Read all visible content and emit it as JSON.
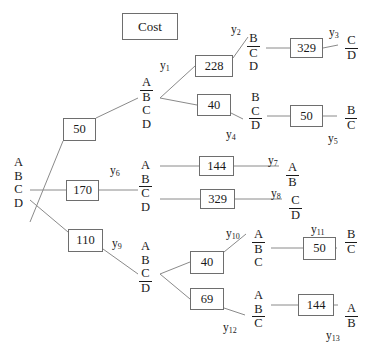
{
  "diagram": {
    "title_box": {
      "label": "Cost",
      "x": 122,
      "y": 13,
      "w": 56,
      "h": 27
    },
    "root": {
      "name": "root-node",
      "letters": [
        {
          "ch": "A",
          "underline": false
        },
        {
          "ch": "B",
          "underline": false
        },
        {
          "ch": "C",
          "underline": false
        },
        {
          "ch": "D",
          "underline": false
        }
      ],
      "x": 12,
      "y": 156
    },
    "nodes": [
      {
        "id": "y1",
        "label": "y",
        "sub": "1",
        "letters": [
          {
            "ch": "A",
            "underline": true
          },
          {
            "ch": "B",
            "underline": false
          },
          {
            "ch": "C",
            "underline": false
          },
          {
            "ch": "D",
            "underline": false
          }
        ],
        "x": 140,
        "y": 76,
        "lx": 160,
        "ly": 60
      },
      {
        "id": "y2",
        "label": "y",
        "sub": "2",
        "letters": [
          {
            "ch": "B",
            "underline": true
          },
          {
            "ch": "C",
            "underline": false
          },
          {
            "ch": "D",
            "underline": false
          }
        ],
        "x": 247,
        "y": 32,
        "lx": 231,
        "ly": 24
      },
      {
        "id": "y3",
        "label": "y",
        "sub": "3",
        "letters": [
          {
            "ch": "C",
            "underline": true
          },
          {
            "ch": "D",
            "underline": false
          }
        ],
        "x": 345,
        "y": 34,
        "lx": 329,
        "ly": 27
      },
      {
        "id": "y4",
        "label": "y",
        "sub": "4",
        "letters": [
          {
            "ch": "B",
            "underline": false
          },
          {
            "ch": "C",
            "underline": true
          },
          {
            "ch": "D",
            "underline": false
          }
        ],
        "x": 249,
        "y": 91,
        "lx": 226,
        "ly": 129
      },
      {
        "id": "y5",
        "label": "y",
        "sub": "5",
        "letters": [
          {
            "ch": "B",
            "underline": true
          },
          {
            "ch": "C",
            "underline": false
          }
        ],
        "x": 345,
        "y": 104,
        "lx": 328,
        "ly": 133
      },
      {
        "id": "y6",
        "label": "y",
        "sub": "6",
        "letters": [
          {
            "ch": "A",
            "underline": false
          },
          {
            "ch": "B",
            "underline": true
          },
          {
            "ch": "C",
            "underline": false
          },
          {
            "ch": "D",
            "underline": false
          }
        ],
        "x": 139,
        "y": 159,
        "lx": 110,
        "ly": 165
      },
      {
        "id": "y7",
        "label": "y",
        "sub": "7",
        "letters": [
          {
            "ch": "A",
            "underline": true
          },
          {
            "ch": "B",
            "underline": false
          }
        ],
        "x": 286,
        "y": 161,
        "lx": 268,
        "ly": 155
      },
      {
        "id": "y8",
        "label": "y",
        "sub": "8",
        "letters": [
          {
            "ch": "C",
            "underline": true
          },
          {
            "ch": "D",
            "underline": false
          }
        ],
        "x": 289,
        "y": 194,
        "lx": 271,
        "ly": 188
      },
      {
        "id": "y9",
        "label": "y",
        "sub": "9",
        "letters": [
          {
            "ch": "A",
            "underline": false
          },
          {
            "ch": "B",
            "underline": false
          },
          {
            "ch": "C",
            "underline": true
          },
          {
            "ch": "D",
            "underline": false
          }
        ],
        "x": 139,
        "y": 240,
        "lx": 112,
        "ly": 238
      },
      {
        "id": "y10",
        "label": "y",
        "sub": "10",
        "letters": [
          {
            "ch": "A",
            "underline": true
          },
          {
            "ch": "B",
            "underline": false
          },
          {
            "ch": "C",
            "underline": false
          }
        ],
        "x": 252,
        "y": 228,
        "lx": 226,
        "ly": 228
      },
      {
        "id": "y11",
        "label": "y",
        "sub": "11",
        "letters": [
          {
            "ch": "B",
            "underline": true
          },
          {
            "ch": "C",
            "underline": false
          }
        ],
        "x": 345,
        "y": 228,
        "lx": 311,
        "ly": 224
      },
      {
        "id": "y12",
        "label": "y",
        "sub": "12",
        "letters": [
          {
            "ch": "A",
            "underline": false
          },
          {
            "ch": "B",
            "underline": true
          },
          {
            "ch": "C",
            "underline": false
          }
        ],
        "x": 252,
        "y": 289,
        "lx": 223,
        "ly": 322
      },
      {
        "id": "y13",
        "label": "y",
        "sub": "13",
        "letters": [
          {
            "ch": "A",
            "underline": true
          },
          {
            "ch": "B",
            "underline": false
          }
        ],
        "x": 345,
        "y": 302,
        "lx": 326,
        "ly": 330
      }
    ],
    "cost_boxes": [
      {
        "id": "cost-50-root-upper",
        "value": "50",
        "x": 63,
        "y": 118,
        "w": 33,
        "h": 23
      },
      {
        "id": "cost-170",
        "value": "170",
        "x": 66,
        "y": 180,
        "w": 33,
        "h": 21
      },
      {
        "id": "cost-110",
        "value": "110",
        "x": 68,
        "y": 229,
        "w": 35,
        "h": 23
      },
      {
        "id": "cost-228",
        "value": "228",
        "x": 195,
        "y": 55,
        "w": 38,
        "h": 22
      },
      {
        "id": "cost-40-upper",
        "value": "40",
        "x": 197,
        "y": 94,
        "w": 34,
        "h": 22
      },
      {
        "id": "cost-329-top",
        "value": "329",
        "x": 290,
        "y": 38,
        "w": 33,
        "h": 20
      },
      {
        "id": "cost-50-y5",
        "value": "50",
        "x": 290,
        "y": 105,
        "w": 33,
        "h": 22
      },
      {
        "id": "cost-144-y7",
        "value": "144",
        "x": 199,
        "y": 156,
        "w": 35,
        "h": 20
      },
      {
        "id": "cost-329-y8",
        "value": "329",
        "x": 200,
        "y": 189,
        "w": 35,
        "h": 20
      },
      {
        "id": "cost-40-y10",
        "value": "40",
        "x": 190,
        "y": 251,
        "w": 34,
        "h": 23
      },
      {
        "id": "cost-69",
        "value": "69",
        "x": 190,
        "y": 288,
        "w": 34,
        "h": 22
      },
      {
        "id": "cost-50-y11",
        "value": "50",
        "x": 303,
        "y": 237,
        "w": 33,
        "h": 23
      },
      {
        "id": "cost-144-y13",
        "value": "144",
        "x": 298,
        "y": 294,
        "w": 36,
        "h": 22
      }
    ],
    "edges": [
      {
        "name": "edge-root-to-50",
        "x1": 30,
        "y1": 222,
        "x2": 63,
        "y2": 141
      },
      {
        "name": "edge-50-to-y1",
        "x1": 96,
        "y1": 118,
        "x2": 138,
        "y2": 98
      },
      {
        "name": "edge-root-to-170",
        "x1": 30,
        "y1": 190,
        "x2": 66,
        "y2": 190
      },
      {
        "name": "edge-170-to-y6",
        "x1": 99,
        "y1": 190,
        "x2": 138,
        "y2": 190
      },
      {
        "name": "edge-root-to-110",
        "x1": 30,
        "y1": 200,
        "x2": 68,
        "y2": 232
      },
      {
        "name": "edge-110-to-y9",
        "x1": 103,
        "y1": 249,
        "x2": 138,
        "y2": 274
      },
      {
        "name": "edge-y1-to-228",
        "x1": 160,
        "y1": 98,
        "x2": 195,
        "y2": 66
      },
      {
        "name": "edge-y1-to-40",
        "x1": 160,
        "y1": 98,
        "x2": 197,
        "y2": 105
      },
      {
        "name": "edge-228-to-y2",
        "x1": 233,
        "y1": 58,
        "x2": 248,
        "y2": 37
      },
      {
        "name": "edge-y2-to-329",
        "x1": 266,
        "y1": 48,
        "x2": 290,
        "y2": 48
      },
      {
        "name": "edge-329-to-y3",
        "x1": 323,
        "y1": 48,
        "x2": 338,
        "y2": 45
      },
      {
        "name": "edge-40-to-y4",
        "x1": 231,
        "y1": 113,
        "x2": 243,
        "y2": 119
      },
      {
        "name": "edge-y4-to-50",
        "x1": 267,
        "y1": 116,
        "x2": 290,
        "y2": 116
      },
      {
        "name": "edge-50-to-y5",
        "x1": 323,
        "y1": 116,
        "x2": 337,
        "y2": 116
      },
      {
        "name": "edge-y6-to-144",
        "x1": 160,
        "y1": 166,
        "x2": 199,
        "y2": 166
      },
      {
        "name": "edge-144-to-y7",
        "x1": 234,
        "y1": 166,
        "x2": 279,
        "y2": 166
      },
      {
        "name": "edge-y6-to-329",
        "x1": 160,
        "y1": 199,
        "x2": 200,
        "y2": 199
      },
      {
        "name": "edge-329-to-y8",
        "x1": 235,
        "y1": 199,
        "x2": 282,
        "y2": 199
      },
      {
        "name": "edge-y9-to-40",
        "x1": 160,
        "y1": 274,
        "x2": 190,
        "y2": 262
      },
      {
        "name": "edge-y9-to-69",
        "x1": 160,
        "y1": 274,
        "x2": 190,
        "y2": 299
      },
      {
        "name": "edge-40-to-y10",
        "x1": 224,
        "y1": 252,
        "x2": 246,
        "y2": 234
      },
      {
        "name": "edge-y10-to-50",
        "x1": 271,
        "y1": 248,
        "x2": 303,
        "y2": 248
      },
      {
        "name": "edge-50-to-y11",
        "x1": 336,
        "y1": 248,
        "x2": 337,
        "y2": 248
      },
      {
        "name": "edge-69-to-y12",
        "x1": 224,
        "y1": 308,
        "x2": 245,
        "y2": 315
      },
      {
        "name": "edge-y12-to-144",
        "x1": 271,
        "y1": 305,
        "x2": 298,
        "y2": 305
      },
      {
        "name": "edge-144-to-y13",
        "x1": 334,
        "y1": 305,
        "x2": 338,
        "y2": 305
      }
    ],
    "colors": {
      "stroke": "#8a8a8a",
      "box_border": "#6e6e6e",
      "text": "#1a1a1a",
      "background": "#ffffff"
    }
  }
}
